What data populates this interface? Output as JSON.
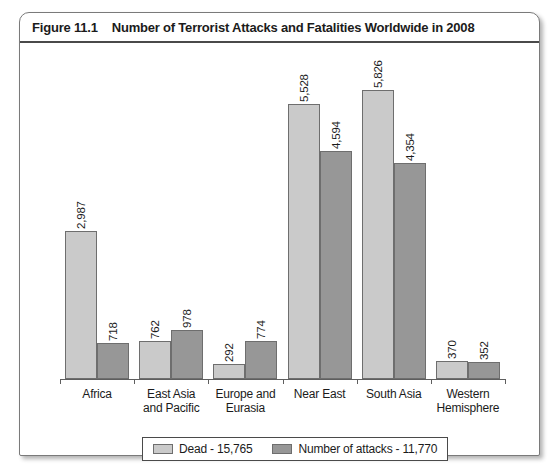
{
  "figure": {
    "number": "Figure 11.1",
    "title": "Number of Terrorist Attacks and Fatalities Worldwide in 2008"
  },
  "legend": {
    "entries": [
      {
        "label": "Dead - 15,765",
        "color": "#cacaca",
        "key": "dead"
      },
      {
        "label": "Number of attacks - 11,770",
        "color": "#979797",
        "key": "attacks"
      }
    ]
  },
  "categories": [
    {
      "line1": "Africa",
      "line2": ""
    },
    {
      "line1": "East Asia",
      "line2": "and Pacific"
    },
    {
      "line1": "Europe and",
      "line2": "Eurasia"
    },
    {
      "line1": "Near East",
      "line2": ""
    },
    {
      "line1": "South Asia",
      "line2": ""
    },
    {
      "line1": "Western",
      "line2": "Hemisphere"
    }
  ],
  "labels": {
    "dead": [
      "2,987",
      "762",
      "292",
      "5,528",
      "5,826",
      "370"
    ],
    "attacks": [
      "718",
      "978",
      "774",
      "4,594",
      "4,354",
      "352"
    ]
  },
  "chart_data": {
    "type": "bar",
    "title": "Number of Terrorist Attacks and Fatalities Worldwide in 2008",
    "xlabel": "",
    "ylabel": "",
    "grid": false,
    "legend_position": "bottom",
    "ylim": [
      0,
      6400
    ],
    "categories": [
      "Africa",
      "East Asia and Pacific",
      "Europe and Eurasia",
      "Near East",
      "South Asia",
      "Western Hemisphere"
    ],
    "series": [
      {
        "name": "Dead - 15,765",
        "color": "#cacaca",
        "total": 15765,
        "values": [
          2987,
          762,
          292,
          5528,
          5826,
          370
        ]
      },
      {
        "name": "Number of attacks - 11,770",
        "color": "#979797",
        "total": 11770,
        "values": [
          718,
          978,
          774,
          4594,
          4354,
          352
        ]
      }
    ]
  }
}
